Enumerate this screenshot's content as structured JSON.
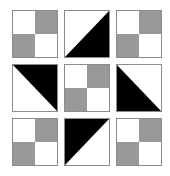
{
  "figure": {
    "title": "",
    "kind": "pattern-tile-grid",
    "rows": 3,
    "columns": 3,
    "background_color": "#ffffff",
    "tile_border_color": "#8c8c8c",
    "colors": {
      "white": "#ffffff",
      "gray": "#999999",
      "black": "#000000"
    }
  },
  "tiles": [
    {
      "index": 1,
      "position": "top-left",
      "pattern": "checkerboard",
      "name": "checkerboard-tile",
      "quadrants": {
        "top_left": "#ffffff",
        "top_right": "#999999",
        "bottom_left": "#999999",
        "bottom_right": "#ffffff"
      }
    },
    {
      "index": 2,
      "position": "top-center",
      "pattern": "diagonal-triangle",
      "name": "triangle-tile",
      "filled_half": "lower-right",
      "diagonal": "top-left-to-bottom-right",
      "fill_color": "#000000",
      "points": "100,0 100,100 0,100"
    },
    {
      "index": 3,
      "position": "top-right",
      "pattern": "checkerboard",
      "name": "checkerboard-tile",
      "quadrants": {
        "top_left": "#ffffff",
        "top_right": "#999999",
        "bottom_left": "#999999",
        "bottom_right": "#ffffff"
      }
    },
    {
      "index": 4,
      "position": "middle-left",
      "pattern": "diagonal-triangle",
      "name": "triangle-tile",
      "filled_half": "upper-right",
      "diagonal": "bottom-left-to-top-right",
      "fill_color": "#000000",
      "points": "0,0 100,0 100,100"
    },
    {
      "index": 5,
      "position": "middle-center",
      "pattern": "checkerboard",
      "name": "checkerboard-tile",
      "quadrants": {
        "top_left": "#ffffff",
        "top_right": "#999999",
        "bottom_left": "#999999",
        "bottom_right": "#ffffff"
      }
    },
    {
      "index": 6,
      "position": "middle-right",
      "pattern": "diagonal-triangle",
      "name": "triangle-tile",
      "filled_half": "lower-left",
      "diagonal": "top-left-to-bottom-right",
      "fill_color": "#000000",
      "points": "0,0 100,100 0,100"
    },
    {
      "index": 7,
      "position": "bottom-left",
      "pattern": "checkerboard",
      "name": "checkerboard-tile",
      "quadrants": {
        "top_left": "#ffffff",
        "top_right": "#999999",
        "bottom_left": "#999999",
        "bottom_right": "#ffffff"
      }
    },
    {
      "index": 8,
      "position": "bottom-center",
      "pattern": "diagonal-triangle",
      "name": "triangle-tile",
      "filled_half": "upper-left",
      "diagonal": "bottom-left-to-top-right",
      "fill_color": "#000000",
      "points": "0,0 100,0 0,100"
    },
    {
      "index": 9,
      "position": "bottom-right",
      "pattern": "checkerboard",
      "name": "checkerboard-tile",
      "quadrants": {
        "top_left": "#ffffff",
        "top_right": "#999999",
        "bottom_left": "#999999",
        "bottom_right": "#ffffff"
      }
    }
  ]
}
